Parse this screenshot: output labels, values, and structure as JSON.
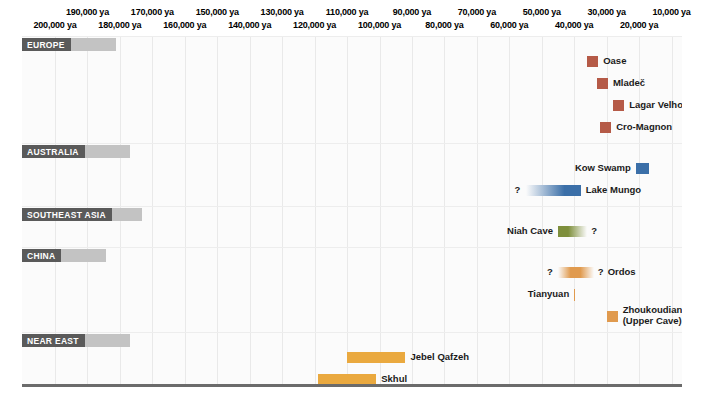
{
  "chart_data": {
    "type": "bar",
    "xlabel": "years ago",
    "ylabel": "",
    "orientation": "horizontal-timeline",
    "xlim": [
      200000,
      5000
    ],
    "x_unit": "ya",
    "grid": true,
    "legend": "none",
    "axis_ticks": [
      {
        "label": "200,000 ya",
        "value": 200000,
        "row": "bottom"
      },
      {
        "label": "190,000 ya",
        "value": 190000,
        "row": "top"
      },
      {
        "label": "180,000 ya",
        "value": 180000,
        "row": "bottom"
      },
      {
        "label": "170,000 ya",
        "value": 170000,
        "row": "top"
      },
      {
        "label": "160,000 ya",
        "value": 160000,
        "row": "bottom"
      },
      {
        "label": "150,000 ya",
        "value": 150000,
        "row": "top"
      },
      {
        "label": "140,000 ya",
        "value": 140000,
        "row": "bottom"
      },
      {
        "label": "130,000 ya",
        "value": 130000,
        "row": "top"
      },
      {
        "label": "120,000 ya",
        "value": 120000,
        "row": "bottom"
      },
      {
        "label": "110,000 ya",
        "value": 110000,
        "row": "top"
      },
      {
        "label": "100,000 ya",
        "value": 100000,
        "row": "bottom"
      },
      {
        "label": "90,000 ya",
        "value": 90000,
        "row": "top"
      },
      {
        "label": "80,000 ya",
        "value": 80000,
        "row": "bottom"
      },
      {
        "label": "70,000 ya",
        "value": 70000,
        "row": "top"
      },
      {
        "label": "60,000 ya",
        "value": 60000,
        "row": "bottom"
      },
      {
        "label": "50,000 ya",
        "value": 50000,
        "row": "top"
      },
      {
        "label": "40,000 ya",
        "value": 40000,
        "row": "bottom"
      },
      {
        "label": "30,000 ya",
        "value": 30000,
        "row": "top"
      },
      {
        "label": "20,000 ya",
        "value": 20000,
        "row": "bottom"
      },
      {
        "label": "10,000 ya",
        "value": 10000,
        "row": "top"
      }
    ],
    "regions": [
      {
        "name": "EUROPE",
        "color": "#b55a47",
        "sites": [
          {
            "name": "Oase",
            "start_ya": 36000,
            "end_ya": 34000,
            "label_side": "right",
            "fade": "none",
            "uncertain_start": false,
            "uncertain_end": false
          },
          {
            "name": "Mladeč",
            "start_ya": 33000,
            "end_ya": 31000,
            "label_side": "right",
            "fade": "none",
            "uncertain_start": false,
            "uncertain_end": false
          },
          {
            "name": "Lagar Velho",
            "start_ya": 28000,
            "end_ya": 26000,
            "label_side": "right",
            "fade": "none",
            "uncertain_start": false,
            "uncertain_end": false
          },
          {
            "name": "Cro-Magnon",
            "start_ya": 32000,
            "end_ya": 30000,
            "label_side": "right",
            "fade": "none",
            "uncertain_start": false,
            "uncertain_end": false
          }
        ]
      },
      {
        "name": "AUSTRALIA",
        "color": "#3b6fa8",
        "sites": [
          {
            "name": "Kow Swamp",
            "start_ya": 21000,
            "end_ya": 17000,
            "label_side": "left",
            "fade": "none",
            "uncertain_start": false,
            "uncertain_end": false
          },
          {
            "name": "Lake Mungo",
            "start_ya": 55000,
            "end_ya": 38000,
            "label_side": "right",
            "fade": "left",
            "uncertain_start": true,
            "uncertain_end": false
          }
        ]
      },
      {
        "name": "SOUTHEAST ASIA",
        "color": "#7e8f3c",
        "sites": [
          {
            "name": "Niah Cave",
            "start_ya": 45000,
            "end_ya": 36000,
            "label_side": "left",
            "fade": "right",
            "uncertain_start": false,
            "uncertain_end": true
          }
        ]
      },
      {
        "name": "CHINA",
        "color": "#e09a4e",
        "sites": [
          {
            "name": "Ordos",
            "start_ya": 45000,
            "end_ya": 34000,
            "label_side": "right",
            "fade": "both",
            "uncertain_start": true,
            "uncertain_end": true
          },
          {
            "name": "Tianyuan",
            "start_ya": 40000,
            "end_ya": 40000,
            "label_side": "left",
            "fade": "none",
            "marker": "tick",
            "uncertain_start": false,
            "uncertain_end": false
          },
          {
            "name": "Zhoukoudian (Upper Cave)",
            "start_ya": 30000,
            "end_ya": 27000,
            "label_side": "right",
            "fade": "none",
            "uncertain_start": false,
            "uncertain_end": false
          }
        ]
      },
      {
        "name": "NEAR EAST",
        "color": "#eaa93f",
        "sites": [
          {
            "name": "Jebel Qafzeh",
            "start_ya": 110000,
            "end_ya": 92000,
            "label_side": "right",
            "fade": "none",
            "uncertain_start": false,
            "uncertain_end": false
          },
          {
            "name": "Skhul",
            "start_ya": 119000,
            "end_ya": 101000,
            "label_side": "right",
            "fade": "none",
            "uncertain_start": false,
            "uncertain_end": false
          }
        ]
      },
      {
        "name": "AFRICA",
        "color": "#8d5a2b",
        "sites": [
          {
            "name": "Omo Kibish",
            "start_ya": 196000,
            "end_ya": 192000,
            "label_side": "right",
            "fade": "none",
            "uncertain_start": false,
            "uncertain_end": false
          },
          {
            "name": "Herto",
            "start_ya": 160000,
            "end_ya": 154000,
            "label_side": "right",
            "fade": "none",
            "uncertain_start": false,
            "uncertain_end": false
          },
          {
            "name": "Klasies River Mouth",
            "start_ya": 124000,
            "end_ya": 116000,
            "label_side": "right",
            "fade": "none",
            "uncertain_start": false,
            "uncertain_end": false
          },
          {
            "name": "Border Cave",
            "start_ya": 90000,
            "end_ya": 76000,
            "label_side": "left",
            "fade": "right",
            "uncertain_start": false,
            "uncertain_end": true
          }
        ]
      }
    ]
  },
  "layout": {
    "uncertain_symbol": "?"
  }
}
